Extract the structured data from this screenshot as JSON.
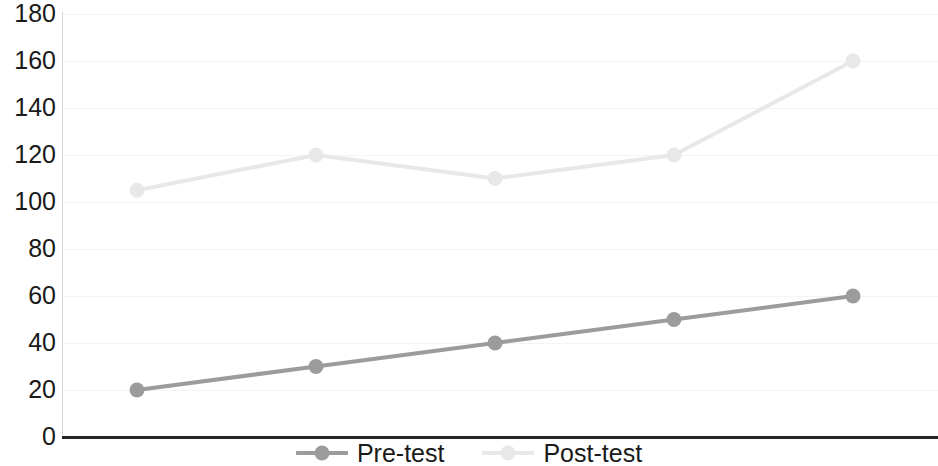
{
  "chart_data": {
    "type": "line",
    "title": "",
    "subtitle": "",
    "xlabel": "",
    "ylabel": "",
    "x": [
      1,
      2,
      3,
      4,
      5
    ],
    "categories": [
      "",
      "",
      "",
      "",
      ""
    ],
    "series": [
      {
        "name": "Pre-test",
        "values": [
          20,
          30,
          40,
          50,
          60
        ],
        "color": "#9c9c9c",
        "marker": "circle"
      },
      {
        "name": "Post-test",
        "values": [
          105,
          120,
          110,
          120,
          160
        ],
        "color": "#e8e8e8",
        "marker": "circle"
      }
    ],
    "ylim": [
      0,
      180
    ],
    "yticks": [
      0,
      20,
      40,
      60,
      80,
      100,
      120,
      140,
      160,
      180
    ],
    "ytick_labels": [
      "0",
      "20",
      "40",
      "60",
      "80",
      "100",
      "120",
      "140",
      "160",
      "180"
    ],
    "xticks": [],
    "xtick_labels": [],
    "grid": true,
    "grid_color": "#f4f4f4",
    "legend_position": "bottom",
    "axis_color": "#262626",
    "background": "#ffffff"
  },
  "axis": {
    "y_labels": [
      "180",
      "160",
      "140",
      "120",
      "100",
      "80",
      "60",
      "40",
      "20",
      "0"
    ]
  },
  "legend": {
    "entries": [
      {
        "label": "Pre-test",
        "color": "#9c9c9c"
      },
      {
        "label": "Post-test",
        "color": "#e8e8e8"
      }
    ]
  }
}
